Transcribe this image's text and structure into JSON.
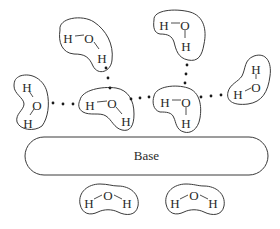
{
  "diagram": {
    "base": {
      "label": "Base",
      "x": 25,
      "y": 137,
      "width": 243,
      "height": 38
    },
    "molecules": [
      {
        "id": "top-left",
        "atoms": [
          {
            "symbol": "H",
            "x": 68,
            "y": 40
          },
          {
            "symbol": "O",
            "x": 89,
            "y": 40
          },
          {
            "symbol": "H",
            "x": 102,
            "y": 60
          }
        ],
        "outline": "M 60 30 C 58 18, 82 14, 94 22 C 106 30, 114 44, 112 60 C 111 72, 98 76, 93 66 C 89 57, 85 54, 74 54 C 62 53, 58 42, 60 30 Z"
      },
      {
        "id": "top-right",
        "atoms": [
          {
            "symbol": "H",
            "x": 164,
            "y": 27
          },
          {
            "symbol": "O",
            "x": 185,
            "y": 27
          },
          {
            "symbol": "H",
            "x": 186,
            "y": 48
          }
        ],
        "outline": "M 154 20 C 153 10, 175 8, 190 12 C 204 16, 207 30, 204 44 C 202 56, 198 62, 188 60 C 178 58, 176 50, 174 42 C 172 36, 168 34, 160 34 C 154 33, 153 27, 154 20 Z"
      },
      {
        "id": "right",
        "atoms": [
          {
            "symbol": "H",
            "x": 256,
            "y": 71
          },
          {
            "symbol": "O",
            "x": 256,
            "y": 89
          },
          {
            "symbol": "H",
            "x": 238,
            "y": 96
          }
        ],
        "outline": "M 254 56 C 266 52, 272 62, 270 76 C 268 92, 262 102, 248 104 C 232 106, 226 100, 228 92 C 230 84, 238 82, 242 76 C 246 68, 244 60, 254 56 Z"
      },
      {
        "id": "left",
        "atoms": [
          {
            "symbol": "H",
            "x": 27,
            "y": 89
          },
          {
            "symbol": "O",
            "x": 37,
            "y": 107
          },
          {
            "symbol": "H",
            "x": 28,
            "y": 125
          }
        ],
        "outline": "M 20 76 C 32 72, 44 80, 47 92 C 50 104, 48 118, 42 126 C 34 132, 20 130, 17 122 C 15 114, 24 110, 24 104 C 24 98, 14 94, 14 86 C 14 80, 16 78, 20 76 Z"
      },
      {
        "id": "center-left",
        "atoms": [
          {
            "symbol": "H",
            "x": 90,
            "y": 107
          },
          {
            "symbol": "O",
            "x": 112,
            "y": 105
          },
          {
            "symbol": "H",
            "x": 126,
            "y": 123
          }
        ],
        "outline": "M 80 100 C 82 90, 102 86, 116 88 C 128 90, 134 100, 134 114 C 134 126, 130 132, 122 130 C 114 128, 112 120, 106 116 C 100 112, 90 116, 83 112 C 78 109, 78 104, 80 100 Z"
      },
      {
        "id": "center-right",
        "atoms": [
          {
            "symbol": "H",
            "x": 165,
            "y": 104
          },
          {
            "symbol": "O",
            "x": 186,
            "y": 104
          },
          {
            "symbol": "H",
            "x": 186,
            "y": 125
          }
        ],
        "outline": "M 154 96 C 156 86, 176 84, 188 88 C 200 92, 202 106, 200 118 C 198 130, 190 134, 184 132 C 176 130, 176 122, 174 118 C 172 112, 166 112, 160 112 C 153 110, 152 102, 154 96 Z"
      },
      {
        "id": "bottom-left",
        "atoms": [
          {
            "symbol": "H",
            "x": 89,
            "y": 205
          },
          {
            "symbol": "O",
            "x": 108,
            "y": 197
          },
          {
            "symbol": "H",
            "x": 127,
            "y": 205
          }
        ],
        "outline": "M 80 204 C 78 192, 88 184, 100 184 C 108 184, 112 186, 118 186 C 130 186, 140 194, 138 206 C 136 216, 126 216, 118 212 C 112 209, 104 209, 98 212 C 90 216, 82 214, 80 204 Z"
      },
      {
        "id": "bottom-right",
        "atoms": [
          {
            "symbol": "H",
            "x": 175,
            "y": 205
          },
          {
            "symbol": "O",
            "x": 194,
            "y": 197
          },
          {
            "symbol": "H",
            "x": 213,
            "y": 205
          }
        ],
        "outline": "M 166 204 C 164 192, 174 184, 186 184 C 194 184, 198 186, 204 186 C 216 186, 226 194, 224 206 C 222 216, 212 216, 204 212 C 198 209, 190 209, 184 212 C 176 216, 168 214, 166 204 Z"
      }
    ],
    "bonds": [
      {
        "x1": 75,
        "y1": 36,
        "x2": 84,
        "y2": 35
      },
      {
        "x1": 94,
        "y1": 42,
        "x2": 99,
        "y2": 49
      },
      {
        "x1": 171,
        "y1": 23,
        "x2": 180,
        "y2": 23
      },
      {
        "x1": 185,
        "y1": 30,
        "x2": 185,
        "y2": 38
      },
      {
        "x1": 256,
        "y1": 74,
        "x2": 256,
        "y2": 79
      },
      {
        "x1": 251,
        "y1": 88,
        "x2": 245,
        "y2": 91
      },
      {
        "x1": 29,
        "y1": 91,
        "x2": 33,
        "y2": 97
      },
      {
        "x1": 34,
        "y1": 109,
        "x2": 30,
        "y2": 115
      },
      {
        "x1": 97,
        "y1": 102,
        "x2": 107,
        "y2": 101
      },
      {
        "x1": 116,
        "y1": 107,
        "x2": 122,
        "y2": 114
      },
      {
        "x1": 172,
        "y1": 100,
        "x2": 181,
        "y2": 100
      },
      {
        "x1": 186,
        "y1": 107,
        "x2": 186,
        "y2": 115
      },
      {
        "x1": 94,
        "y1": 199,
        "x2": 102,
        "y2": 195
      },
      {
        "x1": 114,
        "y1": 195,
        "x2": 122,
        "y2": 199
      },
      {
        "x1": 180,
        "y1": 199,
        "x2": 188,
        "y2": 195
      },
      {
        "x1": 200,
        "y1": 195,
        "x2": 208,
        "y2": 199
      }
    ],
    "hydrogen_bonds": [
      {
        "from": "top-left",
        "to": "center-left",
        "dots": [
          [
            106,
            68
          ],
          [
            108,
            78
          ],
          [
            110,
            88
          ]
        ]
      },
      {
        "from": "left",
        "to": "center-left",
        "dots": [
          [
            53,
            103
          ],
          [
            63,
            104
          ],
          [
            73,
            104
          ]
        ]
      },
      {
        "from": "center-left",
        "to": "center-right",
        "dots": [
          [
            131,
            99
          ],
          [
            140,
            98
          ],
          [
            149,
            97
          ]
        ]
      },
      {
        "from": "top-right",
        "to": "center-right",
        "dots": [
          [
            187,
            65
          ],
          [
            186,
            74
          ],
          [
            185,
            83
          ]
        ]
      },
      {
        "from": "center-right",
        "to": "right",
        "dots": [
          [
            201,
            97
          ],
          [
            211,
            96
          ],
          [
            221,
            95
          ]
        ]
      }
    ],
    "colors": {
      "stroke": "#3a3a3a",
      "text": "#2a2a2a",
      "dot": "#1a1a1a",
      "background": "#ffffff"
    }
  }
}
